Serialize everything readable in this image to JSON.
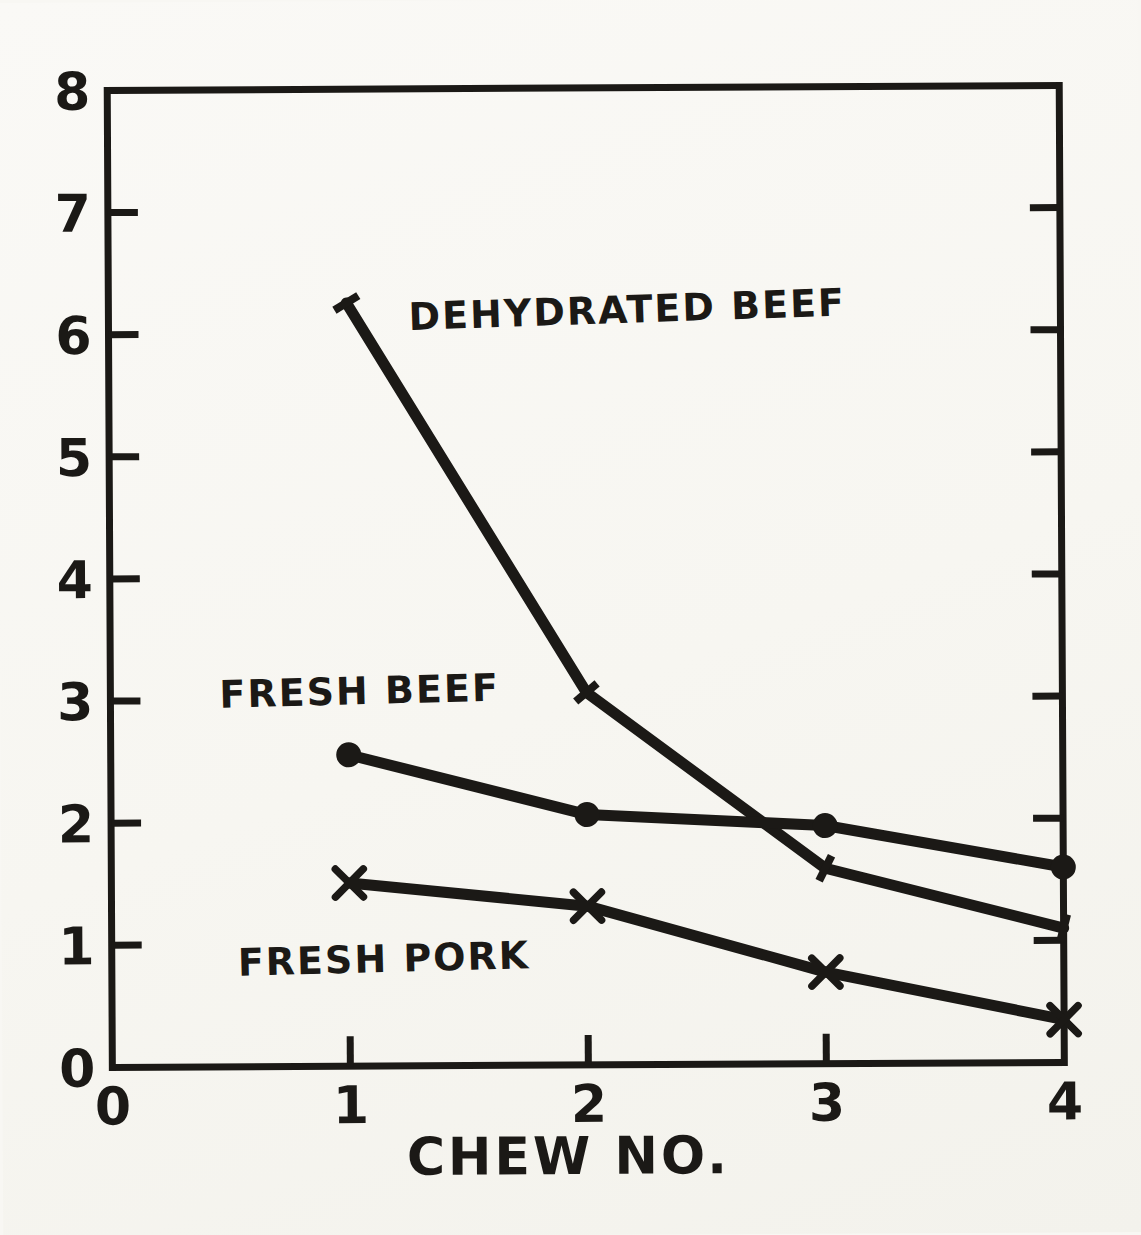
{
  "chart_data": {
    "type": "line",
    "title": "",
    "xlabel": "CHEW NO.",
    "ylabel": "",
    "x": [
      1,
      2,
      3,
      4
    ],
    "xlim": [
      0,
      4
    ],
    "ylim": [
      0,
      8
    ],
    "x_ticks": [
      0,
      1,
      2,
      3,
      4
    ],
    "y_ticks": [
      0,
      1,
      2,
      3,
      4,
      5,
      6,
      7,
      8
    ],
    "grid": false,
    "legend_position": "inline-annotations",
    "series": [
      {
        "name": "DEHYDRATED BEEF",
        "marker": "tick",
        "values": [
          6.25,
          3.05,
          1.6,
          1.1
        ]
      },
      {
        "name": "FRESH BEEF",
        "marker": "circle",
        "values": [
          2.55,
          2.05,
          1.95,
          1.6
        ]
      },
      {
        "name": "FRESH PORK",
        "marker": "x",
        "values": [
          1.5,
          1.3,
          0.75,
          0.35
        ]
      }
    ],
    "colors": {
      "ink": "#1b1916",
      "paper": "#f8f7f3"
    }
  }
}
